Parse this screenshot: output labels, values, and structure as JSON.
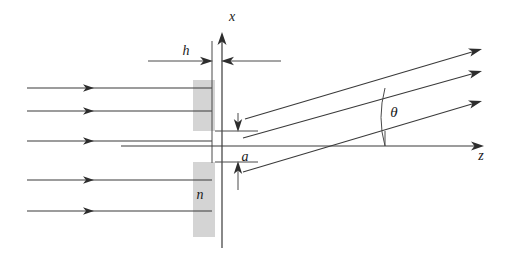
{
  "figure": {
    "background_color": "#ffffff",
    "line_color": "#3a3a3a",
    "slab_color": "#d4d4d4",
    "width": 510,
    "height": 271
  },
  "axes": {
    "vertical": {
      "label": "x",
      "label_x": 232,
      "label_y": 18,
      "x": 222,
      "y_top": 32,
      "y_bottom": 248
    },
    "horizontal": {
      "label": "z",
      "label_x": 481,
      "label_y": 160,
      "y": 146,
      "x_left": 121,
      "x_right": 484
    }
  },
  "labels": {
    "thickness": "h",
    "thickness_x": 186,
    "thickness_y": 51,
    "aperture": "a",
    "aperture_x": 245,
    "aperture_y": 157,
    "refractive_index": "n",
    "refractive_index_x": 200,
    "refractive_index_y": 199,
    "angle": "θ",
    "angle_x": 394,
    "angle_y": 112
  },
  "slab": {
    "left": 193,
    "right": 215,
    "top": 80,
    "bottom": 237,
    "slit_top": 131,
    "slit_bottom": 162,
    "fill": "#d4d4d4"
  },
  "incident_rays": {
    "count": 5,
    "x_start": 27,
    "x_end": 212,
    "arrow_x": 100,
    "y_values": [
      88,
      111,
      141,
      180,
      211
    ]
  },
  "diffracted_rays": {
    "count": 3,
    "angle_degrees": 12,
    "rays": [
      {
        "x1": 245,
        "y1": 119,
        "x2": 481,
        "y2": 49
      },
      {
        "x1": 243,
        "y1": 138,
        "x2": 481,
        "y2": 71
      },
      {
        "x1": 243,
        "y1": 172,
        "x2": 481,
        "y2": 101
      }
    ]
  },
  "angle_arc": {
    "vertex_x": 385,
    "vertex_y": 146,
    "radius": 58,
    "tick_x": 385,
    "tick_y_top": 131,
    "tick_y_bottom": 146
  },
  "dimension_markers": {
    "h": {
      "line_y": 61,
      "left_line_x1": 148,
      "left_line_x2": 212,
      "right_line_x1": 222,
      "right_line_x2": 281,
      "guide_line_1_x": 212,
      "guide_line_2_x": 222,
      "guide_top": 41,
      "guide_bottom": 163
    },
    "a": {
      "line_x": 238,
      "top_y": 113,
      "bottom_y": 190,
      "inner_top_y": 131,
      "inner_bottom_y": 162,
      "tick_x1": 215,
      "tick_x2": 258
    }
  }
}
